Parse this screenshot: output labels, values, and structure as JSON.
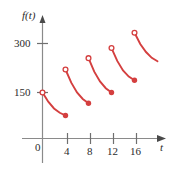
{
  "figure": {
    "background_color": "#ffffff",
    "axis_color": "#8a8a8a",
    "text_color": "#2b2b2b",
    "curve_color": "#d43f3f"
  },
  "axes": {
    "y_axis_name": "f(t)",
    "x_axis_name": "t",
    "y_tick_labels": [
      "300",
      "150"
    ],
    "x_tick_labels": [
      "4",
      "8",
      "12",
      "16"
    ],
    "origin_label": "0"
  },
  "labels": {
    "y_300": "300",
    "y_150": "150",
    "x_0": "0",
    "x_4": "4",
    "x_8": "8",
    "x_12": "12",
    "x_16": "16",
    "y_name": "f(t)",
    "x_name": "t"
  },
  "chart_data": {
    "type": "line",
    "title": "",
    "xlabel": "t",
    "ylabel": "f(t)",
    "xlim": [
      -2,
      21
    ],
    "ylim": [
      0,
      380
    ],
    "xticks": [
      0,
      4,
      8,
      12,
      16
    ],
    "yticks": [
      150,
      300
    ],
    "grid": false,
    "legend": null,
    "series": [
      {
        "name": "branch-1",
        "open_start": {
          "x": 0,
          "y": 150
        },
        "closed_end": {
          "x": 4,
          "y": 75
        },
        "points": [
          {
            "x": 0,
            "y": 150
          },
          {
            "x": 1,
            "y": 120
          },
          {
            "x": 2,
            "y": 98
          },
          {
            "x": 3,
            "y": 84
          },
          {
            "x": 4,
            "y": 75
          }
        ]
      },
      {
        "name": "branch-2",
        "open_start": {
          "x": 4,
          "y": 225
        },
        "closed_end": {
          "x": 8,
          "y": 115
        },
        "points": [
          {
            "x": 4,
            "y": 225
          },
          {
            "x": 5,
            "y": 182
          },
          {
            "x": 6,
            "y": 150
          },
          {
            "x": 7,
            "y": 129
          },
          {
            "x": 8,
            "y": 115
          }
        ]
      },
      {
        "name": "branch-3",
        "open_start": {
          "x": 8,
          "y": 262
        },
        "closed_end": {
          "x": 12,
          "y": 150
        },
        "points": [
          {
            "x": 8,
            "y": 262
          },
          {
            "x": 9,
            "y": 218
          },
          {
            "x": 10,
            "y": 186
          },
          {
            "x": 11,
            "y": 164
          },
          {
            "x": 12,
            "y": 150
          }
        ]
      },
      {
        "name": "branch-4",
        "open_start": {
          "x": 12,
          "y": 295
        },
        "closed_end": {
          "x": 16,
          "y": 190
        },
        "points": [
          {
            "x": 12,
            "y": 295
          },
          {
            "x": 13,
            "y": 253
          },
          {
            "x": 14,
            "y": 222
          },
          {
            "x": 15,
            "y": 202
          },
          {
            "x": 16,
            "y": 190
          }
        ]
      },
      {
        "name": "branch-5",
        "open_start": {
          "x": 16,
          "y": 345
        },
        "closed_end": null,
        "points": [
          {
            "x": 16,
            "y": 345
          },
          {
            "x": 17,
            "y": 308
          },
          {
            "x": 18,
            "y": 282
          },
          {
            "x": 19,
            "y": 263
          },
          {
            "x": 20,
            "y": 252
          }
        ]
      }
    ]
  }
}
